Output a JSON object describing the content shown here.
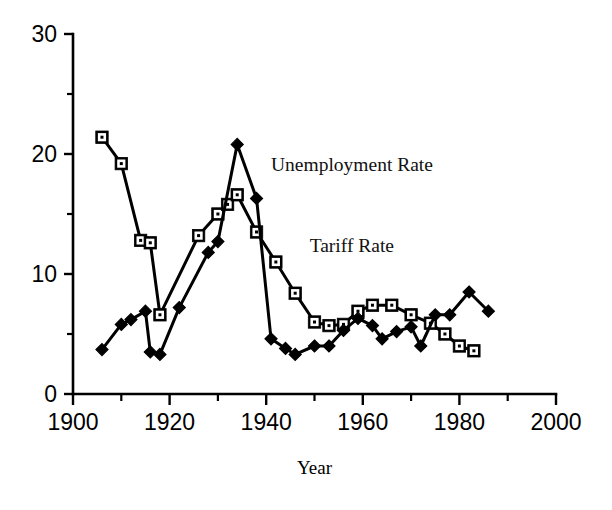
{
  "chart_data": {
    "type": "line",
    "title": "",
    "xlabel": "Year",
    "ylabel": "",
    "xlim": [
      1900,
      2000
    ],
    "ylim": [
      0,
      30
    ],
    "grid": false,
    "legend_position": "inline-annotation",
    "x_ticks_major": [
      1900,
      1920,
      1940,
      1960,
      1980,
      2000
    ],
    "x_ticks_minor": [
      1910,
      1930,
      1950,
      1970,
      1990
    ],
    "x_tick_labels": [
      "1900",
      "1920",
      "1940",
      "1960",
      "1980",
      "2000"
    ],
    "y_ticks_major": [
      0,
      10,
      20,
      30
    ],
    "y_ticks_minor": [
      5,
      15,
      25
    ],
    "y_tick_labels": [
      "0",
      "10",
      "20",
      "30"
    ],
    "series": [
      {
        "name": "Tariff Rate",
        "marker": "open-square",
        "label_x": 1949,
        "label_y": 11.8,
        "points": [
          {
            "x": 1906,
            "y": 21.4
          },
          {
            "x": 1910,
            "y": 19.2
          },
          {
            "x": 1914,
            "y": 12.8
          },
          {
            "x": 1916,
            "y": 12.6
          },
          {
            "x": 1918,
            "y": 6.6
          },
          {
            "x": 1926,
            "y": 13.2
          },
          {
            "x": 1930,
            "y": 15.0
          },
          {
            "x": 1932,
            "y": 15.8
          },
          {
            "x": 1934,
            "y": 16.6
          },
          {
            "x": 1938,
            "y": 13.5
          },
          {
            "x": 1942,
            "y": 11.0
          },
          {
            "x": 1946,
            "y": 8.4
          },
          {
            "x": 1950,
            "y": 6.0
          },
          {
            "x": 1953,
            "y": 5.7
          },
          {
            "x": 1956,
            "y": 5.8
          },
          {
            "x": 1959,
            "y": 6.9
          },
          {
            "x": 1962,
            "y": 7.4
          },
          {
            "x": 1966,
            "y": 7.4
          },
          {
            "x": 1970,
            "y": 6.6
          },
          {
            "x": 1974,
            "y": 5.9
          },
          {
            "x": 1977,
            "y": 5.0
          },
          {
            "x": 1980,
            "y": 4.0
          },
          {
            "x": 1983,
            "y": 3.6
          }
        ]
      },
      {
        "name": "Unemployment Rate",
        "marker": "filled-diamond",
        "label_x": 1941,
        "label_y": 18.6,
        "points": [
          {
            "x": 1906,
            "y": 3.7
          },
          {
            "x": 1910,
            "y": 5.8
          },
          {
            "x": 1912,
            "y": 6.2
          },
          {
            "x": 1915,
            "y": 6.9
          },
          {
            "x": 1916,
            "y": 3.5
          },
          {
            "x": 1918,
            "y": 3.3
          },
          {
            "x": 1922,
            "y": 7.2
          },
          {
            "x": 1928,
            "y": 11.8
          },
          {
            "x": 1930,
            "y": 12.7
          },
          {
            "x": 1934,
            "y": 20.8
          },
          {
            "x": 1938,
            "y": 16.3
          },
          {
            "x": 1941,
            "y": 4.6
          },
          {
            "x": 1944,
            "y": 3.8
          },
          {
            "x": 1946,
            "y": 3.3
          },
          {
            "x": 1950,
            "y": 4.0
          },
          {
            "x": 1953,
            "y": 4.0
          },
          {
            "x": 1956,
            "y": 5.3
          },
          {
            "x": 1959,
            "y": 6.3
          },
          {
            "x": 1962,
            "y": 5.7
          },
          {
            "x": 1964,
            "y": 4.6
          },
          {
            "x": 1967,
            "y": 5.2
          },
          {
            "x": 1970,
            "y": 5.6
          },
          {
            "x": 1972,
            "y": 4.0
          },
          {
            "x": 1975,
            "y": 6.6
          },
          {
            "x": 1978,
            "y": 6.6
          },
          {
            "x": 1982,
            "y": 8.5
          },
          {
            "x": 1986,
            "y": 6.9
          }
        ]
      }
    ]
  },
  "annotations": {
    "unemployment_label": "Unemployment Rate",
    "tariff_label": "Tariff Rate",
    "x_axis_title": "Year"
  },
  "colors": {
    "ink": "#000000",
    "background": "#ffffff"
  }
}
